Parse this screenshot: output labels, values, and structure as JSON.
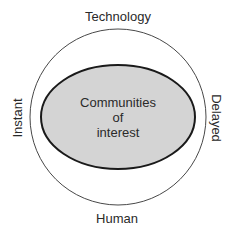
{
  "diagram": {
    "outer_labels": {
      "top": "Technology",
      "bottom": "Human",
      "left": "Instant",
      "right": "Delayed"
    },
    "inner_label_lines": [
      "Communities",
      "of",
      "interest"
    ],
    "colors": {
      "inner_fill": "#d4d4d4",
      "outline": "#1a1a1a",
      "text": "#2a2a2a"
    }
  }
}
